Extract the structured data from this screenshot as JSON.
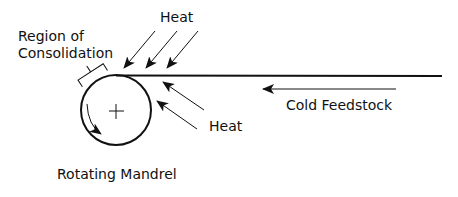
{
  "diagram": {
    "labels": {
      "heat_top": "Heat",
      "heat_right": "Heat",
      "region_line1": "Region of",
      "region_line2": "Consolidation",
      "cold_feedstock": "Cold Feedstock",
      "rotating_mandrel": "Rotating Mandrel"
    },
    "components": [
      {
        "id": "mandrel",
        "name": "Rotating Mandrel",
        "shape": "circle",
        "center_mark": "plus",
        "rotation": "counter-clockwise"
      },
      {
        "id": "feedstock",
        "name": "Cold Feedstock",
        "shape": "line",
        "direction": "toward mandrel"
      },
      {
        "id": "consolidation",
        "name": "Region of Consolidation",
        "shape": "bracket"
      },
      {
        "id": "heat_top",
        "name": "Heat",
        "arrow_count": 3,
        "direction": "down-left onto nip"
      },
      {
        "id": "heat_right",
        "name": "Heat",
        "arrow_count": 2,
        "direction": "up-left onto nip"
      }
    ],
    "colors": {
      "stroke": "#111111",
      "background": "#ffffff"
    }
  }
}
